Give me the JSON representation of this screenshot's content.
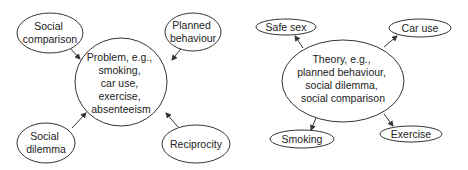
{
  "diagrams": [
    {
      "central": {
        "lines": [
          "Problem, e.g.,",
          "smoking,",
          "car use,",
          "exercise,",
          "absenteeism"
        ]
      },
      "nodes": [
        {
          "lines": [
            "Social",
            "comparison"
          ]
        },
        {
          "lines": [
            "Planned",
            "behaviour"
          ]
        },
        {
          "lines": [
            "Social",
            "dilemma"
          ]
        },
        {
          "lines": [
            "Reciprocity"
          ]
        }
      ],
      "arrow_direction": "inward"
    },
    {
      "central": {
        "lines": [
          "Theory, e.g.,",
          "planned behaviour,",
          "social dilemma,",
          "social comparison"
        ]
      },
      "nodes": [
        {
          "lines": [
            "Safe sex"
          ]
        },
        {
          "lines": [
            "Car use"
          ]
        },
        {
          "lines": [
            "Smoking"
          ]
        },
        {
          "lines": [
            "Exercise"
          ]
        }
      ],
      "arrow_direction": "outward"
    }
  ],
  "colors": {
    "stroke": "#333333",
    "text": "#222222",
    "background": "#ffffff"
  }
}
